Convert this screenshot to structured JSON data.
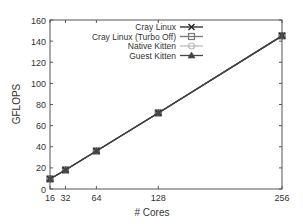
{
  "chart_data": {
    "type": "line",
    "title": "",
    "xlabel": "# Cores",
    "ylabel": "GFLOPS",
    "x": [
      16,
      32,
      64,
      128,
      256
    ],
    "xticks": [
      16,
      32,
      64,
      128,
      256
    ],
    "yticks": [
      0,
      20,
      40,
      60,
      80,
      100,
      120,
      140,
      160
    ],
    "xlim": [
      16,
      256
    ],
    "ylim": [
      0,
      160
    ],
    "grid": false,
    "legend_position": "top-left inside",
    "series": [
      {
        "name": "Cray Linux",
        "marker": "x-cross",
        "color": "#222222",
        "values": [
          9.5,
          18,
          36,
          72,
          145
        ]
      },
      {
        "name": "Cray Linux (Turbo Off)",
        "marker": "square-open",
        "color": "#777777",
        "values": [
          9.5,
          18,
          36,
          72,
          145
        ]
      },
      {
        "name": "Native Kitten",
        "marker": "circle-open",
        "color": "#bbbbbb",
        "values": [
          9.5,
          18,
          36,
          72,
          145
        ]
      },
      {
        "name": "Guest Kitten",
        "marker": "triangle-filled",
        "color": "#444444",
        "values": [
          9.5,
          18,
          36,
          72,
          145
        ]
      }
    ]
  }
}
